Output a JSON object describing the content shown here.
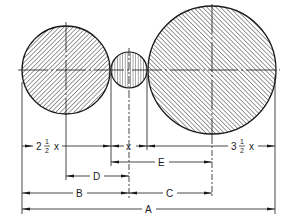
{
  "diagram": {
    "type": "engineering-dimension-drawing",
    "circles": [
      {
        "name": "left-circle",
        "cx": 66,
        "cy": 70,
        "r": 44,
        "hatch": "diagonal"
      },
      {
        "name": "small-circle",
        "cx": 129,
        "cy": 70,
        "r": 18,
        "hatch": "vertical"
      },
      {
        "name": "right-circle",
        "cx": 212,
        "cy": 70,
        "r": 64,
        "hatch": "diagonal"
      }
    ],
    "dimensions": {
      "left_diameter": {
        "whole": "2",
        "num": "1",
        "den": "2",
        "var": "x"
      },
      "small_diameter": {
        "var": "x"
      },
      "right_diameter": {
        "whole": "3",
        "num": "1",
        "den": "2",
        "var": "x"
      },
      "A": "A",
      "B": "B",
      "C": "C",
      "D": "D",
      "E": "E"
    },
    "colors": {
      "ink": "#1a1a1a",
      "background": "#ffffff"
    }
  }
}
